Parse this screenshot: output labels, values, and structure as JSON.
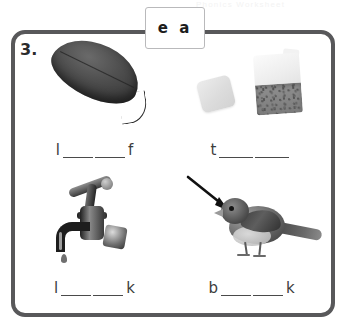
{
  "page": {
    "ghost_header_text": "Phonics Worksheet",
    "background_color": "#ffffff"
  },
  "exercise": {
    "number_label": "3.",
    "vowel_box": {
      "label": "e a",
      "border_color": "#b9b9bb"
    },
    "frame": {
      "border_color": "#58585a"
    },
    "items": [
      {
        "picture": "leaf-photo",
        "answer": {
          "first_letter": "l",
          "blank_count": 2,
          "last_letter": "f"
        }
      },
      {
        "picture": "tea-bags-photo",
        "answer": {
          "first_letter": "t",
          "blank_count": 2,
          "last_letter": ""
        }
      },
      {
        "picture": "tap-faucet-photo",
        "answer": {
          "first_letter": "l",
          "blank_count": 2,
          "last_letter": "k"
        }
      },
      {
        "picture": "bird-beak-photo",
        "answer": {
          "first_letter": "b",
          "blank_count": 2,
          "last_letter": "k"
        }
      }
    ]
  }
}
